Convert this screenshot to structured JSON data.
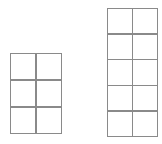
{
  "figure": {
    "background_color": "#ffffff",
    "stroke_color": "#8a8a8a",
    "cell_fill_color": "#ffffff",
    "canvas_width": 162,
    "canvas_height": 144,
    "shapes": [
      {
        "id": "grid-left",
        "name": "left-rectangle",
        "columns": 2,
        "rows": 3,
        "total_cells": 6,
        "x": 10,
        "y": 53,
        "width": 52,
        "height": 81,
        "cells": [
          {
            "row": 1,
            "col": 1,
            "label": ""
          },
          {
            "row": 1,
            "col": 2,
            "label": ""
          },
          {
            "row": 2,
            "col": 1,
            "label": ""
          },
          {
            "row": 2,
            "col": 2,
            "label": ""
          },
          {
            "row": 3,
            "col": 1,
            "label": ""
          },
          {
            "row": 3,
            "col": 2,
            "label": ""
          }
        ]
      },
      {
        "id": "grid-right",
        "name": "right-rectangle",
        "columns": 2,
        "rows": 5,
        "total_cells": 10,
        "x": 107,
        "y": 8,
        "width": 51,
        "height": 129,
        "cells": [
          {
            "row": 1,
            "col": 1,
            "label": ""
          },
          {
            "row": 1,
            "col": 2,
            "label": ""
          },
          {
            "row": 2,
            "col": 1,
            "label": ""
          },
          {
            "row": 2,
            "col": 2,
            "label": ""
          },
          {
            "row": 3,
            "col": 1,
            "label": ""
          },
          {
            "row": 3,
            "col": 2,
            "label": ""
          },
          {
            "row": 4,
            "col": 1,
            "label": ""
          },
          {
            "row": 4,
            "col": 2,
            "label": ""
          },
          {
            "row": 5,
            "col": 1,
            "label": ""
          },
          {
            "row": 5,
            "col": 2,
            "label": ""
          }
        ]
      }
    ]
  }
}
